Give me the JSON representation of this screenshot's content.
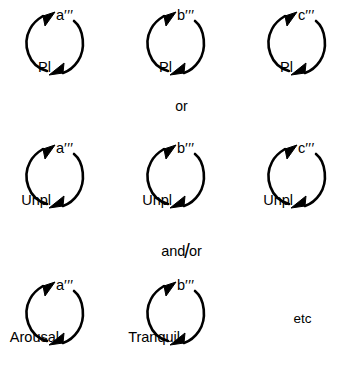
{
  "figure": {
    "background_color": "#ffffff",
    "stroke_color": "#000000",
    "rows": [
      {
        "id": "row-pleasant",
        "cells": [
          {
            "type": "cycle",
            "top_label": "a",
            "top_primes": "′′′",
            "bottom_label": "Pl"
          },
          {
            "type": "cycle",
            "top_label": "b",
            "top_primes": "′′′",
            "bottom_label": "Pl"
          },
          {
            "type": "cycle",
            "top_label": "c",
            "top_primes": "′′′",
            "bottom_label": "Pl"
          }
        ]
      },
      {
        "id": "row-unpleasant",
        "cells": [
          {
            "type": "cycle",
            "top_label": "a",
            "top_primes": "′′′",
            "bottom_label": "Unpl"
          },
          {
            "type": "cycle",
            "top_label": "b",
            "top_primes": "′′′",
            "bottom_label": "Unpl"
          },
          {
            "type": "cycle",
            "top_label": "c",
            "top_primes": "′′′",
            "bottom_label": "Unpl"
          }
        ]
      },
      {
        "id": "row-arousal",
        "cells": [
          {
            "type": "cycle",
            "top_label": "a",
            "top_primes": "′′′",
            "bottom_label": "Arousal"
          },
          {
            "type": "cycle",
            "top_label": "b",
            "top_primes": "′′′",
            "bottom_label": "Tranquil"
          },
          {
            "type": "text",
            "text": "etc"
          }
        ]
      }
    ],
    "connectors": {
      "first": "or",
      "second_prefix": "and",
      "second_slash": "/",
      "second_suffix": "or"
    }
  }
}
